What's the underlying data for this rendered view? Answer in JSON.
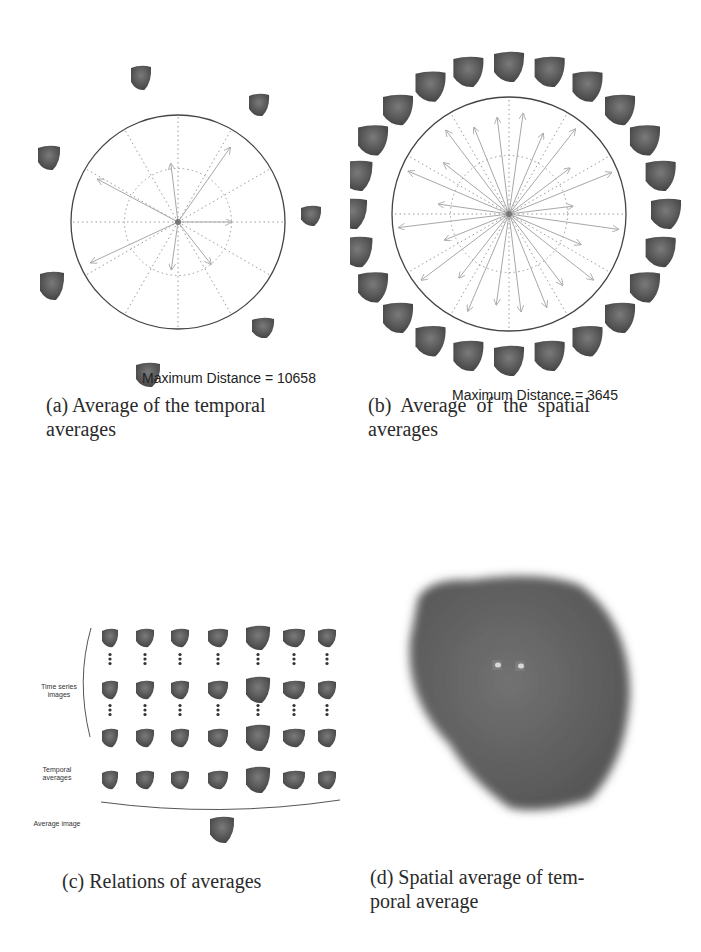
{
  "figure": {
    "panels": [
      {
        "id": "a",
        "caption_line1": "(a) Average of the temporal",
        "caption_line2": "averages",
        "max_distance_label": "Maximum Distance = 10658",
        "circle": {
          "cx": 178,
          "cy": 222,
          "r": 107
        },
        "blob_count": 7
      },
      {
        "id": "b",
        "caption_line1": "(b)  Average  of  the  spatial",
        "caption_line2": "averages",
        "max_distance_label": "Maximum Distance = 3645",
        "circle": {
          "cx": 509,
          "cy": 214,
          "r": 117
        },
        "blob_count": 24
      },
      {
        "id": "c",
        "caption": "(c) Relations of averages",
        "labels": {
          "time_series": "Time series images",
          "temporal": "Temporal averages",
          "average": "Average image"
        },
        "columns": 7
      },
      {
        "id": "d",
        "caption_line1": "(d) Spatial average of tem-",
        "caption_line2": "poral average"
      }
    ],
    "colors": {
      "blob": "#5a5a5a",
      "blob_dark": "#454545",
      "grid": "#9a9a9a",
      "circle": "#444444",
      "arrow": "#a8a8a8"
    }
  }
}
